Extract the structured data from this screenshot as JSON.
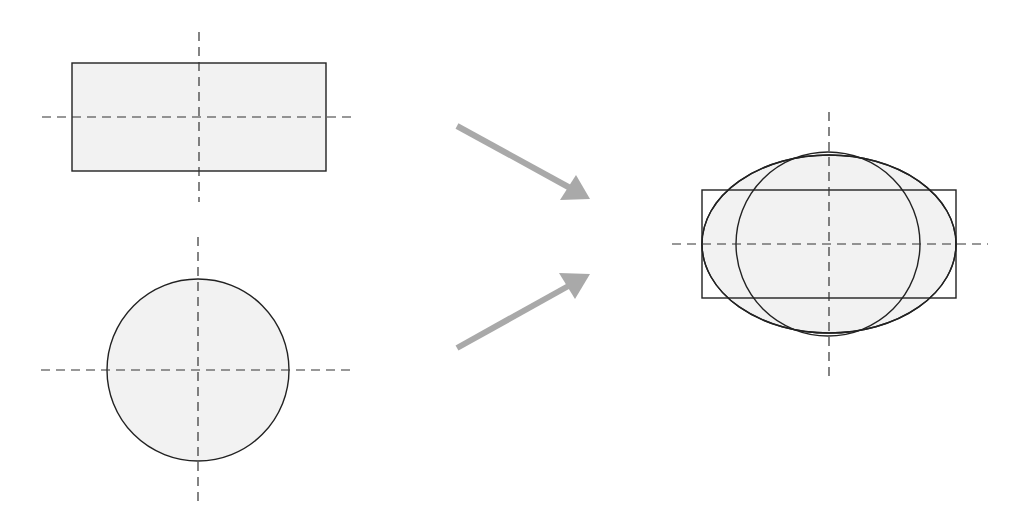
{
  "diagram": {
    "colors": {
      "fill": "#f2f2f2",
      "stroke": "#222222",
      "axis": "#333333",
      "arrow": "#a9a9a9"
    },
    "inputs": [
      {
        "shape": "rectangle",
        "label": "rectangle",
        "center": [
          199,
          117
        ],
        "width": 254,
        "height": 108
      },
      {
        "shape": "circle",
        "label": "circle",
        "center": [
          198,
          370
        ],
        "radius": 91
      }
    ],
    "arrows": [
      {
        "from": [
          457,
          126
        ],
        "to": [
          590,
          199
        ]
      },
      {
        "from": [
          457,
          348
        ],
        "to": [
          590,
          274
        ]
      }
    ],
    "output": {
      "center": [
        829,
        244
      ],
      "rectangle": {
        "width": 254,
        "height": 108
      },
      "circle": {
        "radius": 91
      },
      "ellipse": {
        "rx": 127,
        "ry": 89
      }
    }
  }
}
